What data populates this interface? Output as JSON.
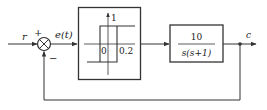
{
  "diagram": {
    "type": "block-diagram",
    "input_label": "r",
    "sum_plus_sign": "+",
    "sum_minus_sign": "−",
    "error_label": "e(t)",
    "nonlinearity": {
      "kind": "relay-with-hysteresis",
      "output_level_label": "1",
      "origin_label": "0",
      "threshold_label": "0.2"
    },
    "plant": {
      "numerator": "10",
      "denominator": "s(s+1)"
    },
    "output_label": "c",
    "feedback": "unity-negative"
  },
  "colors": {
    "stroke": "#333333",
    "background": "#ffffff"
  }
}
